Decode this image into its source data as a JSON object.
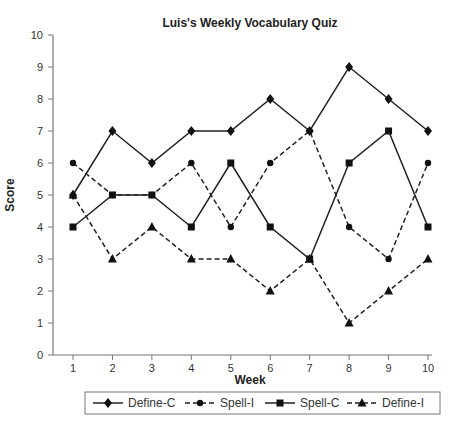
{
  "chart_data": {
    "type": "line",
    "title": "Luis's Weekly Vocabulary Quiz",
    "xlabel": "Week",
    "ylabel": "Score",
    "x": [
      1,
      2,
      3,
      4,
      5,
      6,
      7,
      8,
      9,
      10
    ],
    "ylim": [
      0,
      10
    ],
    "yticks": [
      0,
      1,
      2,
      3,
      4,
      5,
      6,
      7,
      8,
      9,
      10
    ],
    "grid": false,
    "legend_position": "bottom",
    "series": [
      {
        "name": "Define-C",
        "style": "solid",
        "marker": "diamond",
        "values": [
          5,
          7,
          6,
          7,
          7,
          8,
          7,
          9,
          8,
          7
        ]
      },
      {
        "name": "Spell-I",
        "style": "dashed",
        "marker": "circle",
        "values": [
          6,
          5,
          5,
          6,
          4,
          6,
          7,
          4,
          3,
          6
        ]
      },
      {
        "name": "Spell-C",
        "style": "solid",
        "marker": "square",
        "values": [
          4,
          5,
          5,
          4,
          6,
          4,
          3,
          6,
          7,
          4
        ]
      },
      {
        "name": "Define-I",
        "style": "dashed",
        "marker": "triangle",
        "values": [
          5,
          3,
          4,
          3,
          3,
          2,
          3,
          1,
          2,
          3
        ]
      }
    ]
  }
}
